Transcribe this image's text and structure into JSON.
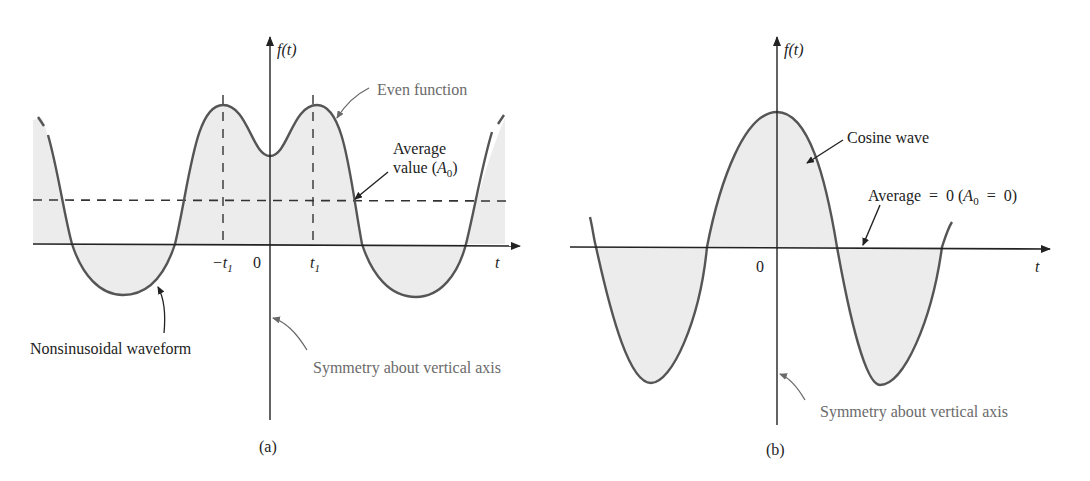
{
  "figure": {
    "panel_a": {
      "caption": "(a)",
      "y_axis_label": "f(t)",
      "x_axis_label": "t",
      "tick_labels": {
        "neg_t1": "−t",
        "neg_t1_sub": "1",
        "zero": "0",
        "t1": "t",
        "t1_sub": "1"
      },
      "annotations": {
        "even_function": "Even function",
        "average_line1": "Average",
        "average_line2_prefix": "value (",
        "average_A": "A",
        "average_sub": "0",
        "average_suffix": ")",
        "nonsinusoidal": "Nonsinusoidal waveform",
        "symmetry": "Symmetry about vertical axis"
      }
    },
    "panel_b": {
      "caption": "(b)",
      "y_axis_label": "f(t)",
      "x_axis_label": "t",
      "tick_labels": {
        "zero": "0"
      },
      "annotations": {
        "cosine_wave": "Cosine wave",
        "average_prefix": "Average  =  0 (",
        "average_A": "A",
        "average_sub": "0",
        "average_suffix": "  =  0)",
        "symmetry": "Symmetry about vertical axis"
      }
    },
    "colors": {
      "curve": "#555555",
      "fill": "#ececec",
      "axis": "#222222",
      "annotation_gray": "#6a6a6a"
    }
  }
}
